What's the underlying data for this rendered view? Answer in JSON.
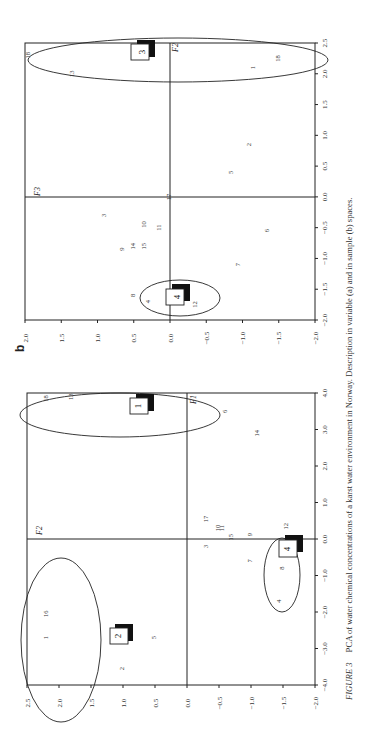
{
  "figure": {
    "caption_label": "FIGURE 3",
    "caption_text": "PCA of water chemical concentrations of a karst water environment in Norway. Description in variable (a) and in sample (b) spaces.",
    "orientation": "rotated 90° counter-clockwise on page"
  },
  "chart_data": [
    {
      "type": "scatter",
      "panel": "a",
      "title": "",
      "xlabel": "F1",
      "ylabel": "F2",
      "xlim": [
        -4.0,
        4.0
      ],
      "ylim": [
        -2.0,
        2.5
      ],
      "xticks": [
        "-4.0",
        "-3.0",
        "-2.0",
        "-1.0",
        "0.0",
        "1.0",
        "2.0",
        "3.0",
        "4.0"
      ],
      "yticks": [
        "2.5",
        "2.0",
        "1.5",
        "1.0",
        "0.5",
        "0.0",
        "-0.5",
        "-1.0",
        "-1.5",
        "-2.0"
      ],
      "points": [
        {
          "label": "18",
          "x": 3.85,
          "y": 2.2
        },
        {
          "label": "13",
          "x": 3.9,
          "y": 1.8
        },
        {
          "label": "6",
          "x": 3.5,
          "y": -0.6
        },
        {
          "label": "14",
          "x": 2.9,
          "y": -1.1
        },
        {
          "label": "17",
          "x": 0.55,
          "y": -0.3
        },
        {
          "label": "10",
          "x": 0.3,
          "y": -0.5
        },
        {
          "label": "11",
          "x": 0.3,
          "y": -0.55
        },
        {
          "label": "15",
          "x": 0.05,
          "y": -0.7
        },
        {
          "label": "9",
          "x": 0.12,
          "y": -1.0
        },
        {
          "label": "3",
          "x": -0.2,
          "y": -0.3
        },
        {
          "label": "7",
          "x": -0.6,
          "y": -1.0
        },
        {
          "label": "12",
          "x": 0.35,
          "y": -1.55
        },
        {
          "label": "8",
          "x": -0.8,
          "y": -1.5
        },
        {
          "label": "4",
          "x": -1.7,
          "y": -1.45
        },
        {
          "label": "16",
          "x": -2.05,
          "y": 2.2
        },
        {
          "label": "1",
          "x": -2.7,
          "y": 2.2
        },
        {
          "label": "5",
          "x": -2.7,
          "y": 0.5
        },
        {
          "label": "2",
          "x": -3.55,
          "y": 1.0
        }
      ],
      "groups": [
        {
          "id": "1",
          "center_x": 3.5,
          "center_y": 1.25,
          "members": [
            "18",
            "13",
            "6",
            "14"
          ]
        },
        {
          "id": "2",
          "center_x": -2.2,
          "center_y": 1.15,
          "members": [
            "16",
            "1",
            "5",
            "2"
          ]
        },
        {
          "id": "4",
          "center_x": -0.1,
          "center_y": -1.4,
          "members": [
            "12",
            "8",
            "4"
          ]
        }
      ],
      "grid": false
    },
    {
      "type": "scatter",
      "panel": "b",
      "title": "",
      "xlabel": "F2",
      "ylabel": "F3",
      "xlim": [
        -2.0,
        2.5
      ],
      "ylim": [
        -2.0,
        2.0
      ],
      "xticks": [
        "-2.0",
        "-1.5",
        "-1.0",
        "-0.5",
        "0.0",
        "0.5",
        "1.0",
        "1.5",
        "2.0",
        "2.5"
      ],
      "yticks": [
        "2.0",
        "1.5",
        "1.0",
        "0.5",
        "0.0",
        "-0.5",
        "-1.0",
        "-1.5",
        "-2.0"
      ],
      "points": [
        {
          "label": "18",
          "x": 2.3,
          "y": 1.95
        },
        {
          "label": "13",
          "x": 2.0,
          "y": 1.35
        },
        {
          "label": "18",
          "x": 2.25,
          "y": -1.5
        },
        {
          "label": "1",
          "x": 2.1,
          "y": -1.15
        },
        {
          "label": "2",
          "x": 0.85,
          "y": -1.1
        },
        {
          "label": "5",
          "x": 0.4,
          "y": -0.85
        },
        {
          "label": "17",
          "x": 0.0,
          "y": 0.0
        },
        {
          "label": "3",
          "x": -0.3,
          "y": 0.9
        },
        {
          "label": "10",
          "x": -0.45,
          "y": 0.35
        },
        {
          "label": "11",
          "x": -0.5,
          "y": 0.15
        },
        {
          "label": "14",
          "x": -0.8,
          "y": 0.5
        },
        {
          "label": "15",
          "x": -0.8,
          "y": 0.35
        },
        {
          "label": "9",
          "x": -0.85,
          "y": 0.65
        },
        {
          "label": "6",
          "x": -0.55,
          "y": -1.35
        },
        {
          "label": "7",
          "x": -1.1,
          "y": -0.95
        },
        {
          "label": "8",
          "x": -1.6,
          "y": 0.5
        },
        {
          "label": "4",
          "x": -1.7,
          "y": 0.3
        },
        {
          "label": "12",
          "x": -1.75,
          "y": -0.35
        }
      ],
      "groups": [
        {
          "id": "3",
          "center_x": 2.3,
          "center_y": -0.1,
          "members": [
            "18",
            "13",
            "1"
          ]
        },
        {
          "id": "4",
          "center_x": -1.7,
          "center_y": -0.05,
          "members": [
            "8",
            "4",
            "12"
          ]
        }
      ],
      "grid": false
    }
  ],
  "labels": {
    "panel_b": "b",
    "axis_a_h": "F1",
    "axis_a_v": "F2",
    "axis_b_h": "F2",
    "axis_b_v": "F3"
  }
}
